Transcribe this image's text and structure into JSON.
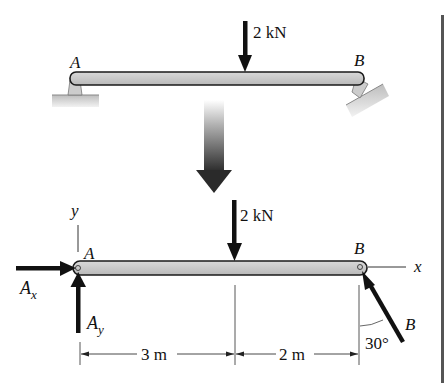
{
  "figure": {
    "type": "free-body-diagram",
    "top_diagram": {
      "load_label": "2 kN",
      "support_a_label": "A",
      "support_b_label": "B",
      "support_a_type": "pin",
      "support_b_type": "inclined roller"
    },
    "transition_arrow": "down-arrow",
    "bottom_diagram": {
      "load_label": "2 kN",
      "point_a_label": "A",
      "point_b_label": "B",
      "axis_x_label": "x",
      "axis_y_label": "y",
      "reaction_ax": {
        "base": "A",
        "sub": "x"
      },
      "reaction_ay": {
        "base": "A",
        "sub": "y"
      },
      "reaction_b_label": "B",
      "angle_label": "30°",
      "dimensions": [
        {
          "label": "3 m"
        },
        {
          "label": "2 m"
        }
      ]
    }
  },
  "colors": {
    "beam_fill": "#c8c8c8",
    "beam_stroke": "#1a1a1a",
    "arrow": "#111111",
    "support_fill": "#cfcfcf",
    "right_bar": "#555555"
  }
}
